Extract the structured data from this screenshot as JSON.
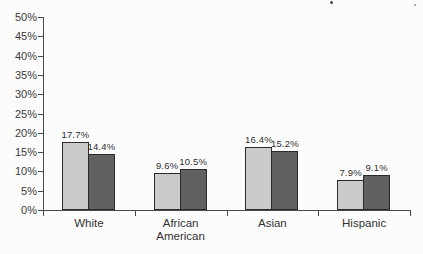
{
  "chart_data": {
    "type": "bar",
    "title": "",
    "categories": [
      "White",
      "African American",
      "Asian",
      "Hispanic"
    ],
    "series": [
      {
        "name": "light-gray-series",
        "color": "#cbcbcb",
        "values": [
          17.7,
          9.6,
          16.4,
          7.9
        ]
      },
      {
        "name": "dark-gray-series",
        "color": "#616161",
        "values": [
          14.4,
          10.5,
          15.2,
          9.1
        ]
      }
    ],
    "value_labels": [
      [
        "17.7%",
        "9.6%",
        "16.4%",
        "7.9%"
      ],
      [
        "14.4%",
        "10.5%",
        "15.2%",
        "9.1%"
      ]
    ],
    "xlabel": "",
    "ylabel": "",
    "ylim": [
      0,
      50
    ],
    "ytick_step": 5,
    "ytick_labels": [
      "0%",
      "5%",
      "10%",
      "15%",
      "20%",
      "25%",
      "30%",
      "35%",
      "40%",
      "45%",
      "50%"
    ],
    "grid": false,
    "legend": "none",
    "colors": {
      "axis": "#4a4a4a",
      "bar_border": "#2a2a2a",
      "text": "#333333",
      "background": "#fcfcfc"
    }
  }
}
